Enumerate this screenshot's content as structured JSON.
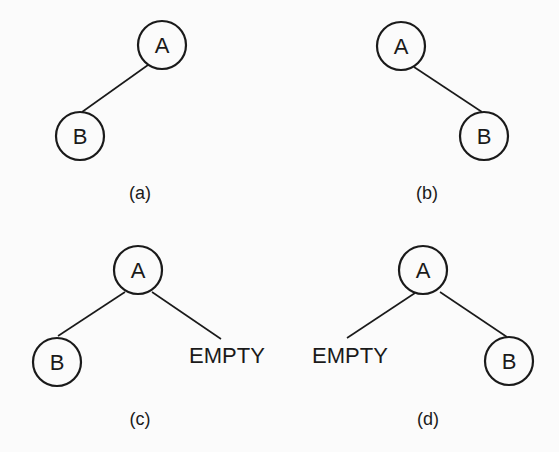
{
  "diagrams": [
    {
      "id": "a",
      "caption": "(a)",
      "root": {
        "label": "A"
      },
      "left": {
        "type": "node",
        "label": "B"
      },
      "right": null
    },
    {
      "id": "b",
      "caption": "(b)",
      "root": {
        "label": "A"
      },
      "left": null,
      "right": {
        "type": "node",
        "label": "B"
      }
    },
    {
      "id": "c",
      "caption": "(c)",
      "root": {
        "label": "A"
      },
      "left": {
        "type": "node",
        "label": "B"
      },
      "right": {
        "type": "empty",
        "label": "EMPTY"
      }
    },
    {
      "id": "d",
      "caption": "(d)",
      "root": {
        "label": "A"
      },
      "left": {
        "type": "empty",
        "label": "EMPTY"
      },
      "right": {
        "type": "node",
        "label": "B"
      }
    }
  ]
}
